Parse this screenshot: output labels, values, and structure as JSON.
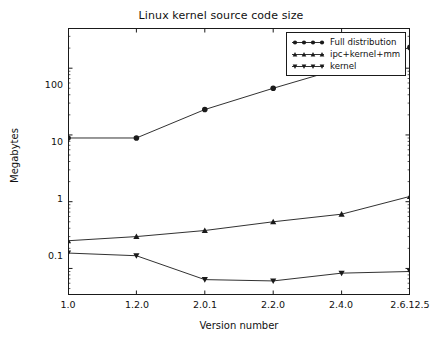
{
  "chart_data": {
    "type": "line",
    "title": "Linux kernel source code size",
    "xlabel": "Version number",
    "ylabel": "Megabytes",
    "categories": [
      "1.0",
      "1.2.0",
      "2.0.1",
      "2.2.0",
      "2.4.0",
      "2.6.12.5"
    ],
    "yscale": "log",
    "ylim": [
      0.04,
      400
    ],
    "yticks": [
      "0.1",
      "1",
      "10",
      "100"
    ],
    "ytick_values": [
      0.1,
      1,
      10,
      100
    ],
    "grid": false,
    "legend_position": "upper right",
    "series": [
      {
        "name": "Full distribution",
        "marker": "circle",
        "values": [
          9.0,
          9.0,
          24.0,
          50.0,
          100.0,
          205.0
        ]
      },
      {
        "name": "ipc+kernel+mm",
        "marker": "triangle-up",
        "values": [
          0.26,
          0.3,
          0.37,
          0.5,
          0.65,
          1.2
        ]
      },
      {
        "name": "kernel",
        "marker": "triangle-down",
        "values": [
          0.17,
          0.155,
          0.068,
          0.065,
          0.085,
          0.09
        ]
      }
    ]
  },
  "legend": {
    "items": [
      {
        "label": "Full distribution"
      },
      {
        "label": "ipc+kernel+mm"
      },
      {
        "label": "kernel"
      }
    ]
  }
}
